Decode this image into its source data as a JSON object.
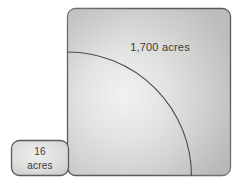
{
  "figure": {
    "type": "area-comparison-diagram",
    "canvas": {
      "width": 244,
      "height": 181,
      "background": "#ffffff"
    },
    "colors": {
      "fill_light": "#f0f0ef",
      "fill_mid": "#d2d2d1",
      "fill_dark": "#bcbcbb",
      "stroke": "#5a5a5a",
      "arc_stroke": "#4d4d4d",
      "text": "#3b3b3b"
    },
    "shapes": [
      {
        "name": "large-square",
        "label": "1,700 acres",
        "value": 1700,
        "unit": "acres",
        "x": 67,
        "y": 8,
        "width": 164,
        "height": 168,
        "corner_radius": 8
      },
      {
        "name": "small-square",
        "label_line_1": "16",
        "label_line_2": "acres",
        "value": 16,
        "unit": "acres",
        "x": 11,
        "y": 140,
        "width": 58,
        "height": 36,
        "corner_radius": 8
      }
    ],
    "arc": {
      "name": "quarter-circle-arc",
      "center_x": 67,
      "center_y": 176,
      "radius": 124,
      "start_x": 67,
      "start_y": 52,
      "end_x": 191,
      "end_y": 176
    }
  }
}
